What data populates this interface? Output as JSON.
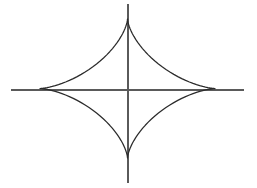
{
  "figure": {
    "background_color": "#ffffff",
    "width": 257,
    "height": 188
  },
  "chart_data": {
    "type": "line",
    "title": "",
    "subtitle": "",
    "xlabel": "",
    "ylabel": "",
    "grid": false,
    "legend_position": "none",
    "tick_labels_x": [],
    "tick_labels_y": [],
    "annotations": [],
    "curve_name": "astroid",
    "curve_equation": "|x/a|^(2/3) + |y/b|^(2/3) = 1",
    "axes": {
      "x_axis": {
        "y_pixel": 90,
        "x_start_pixel": 11,
        "x_end_pixel": 244,
        "color": "#5a5a5a"
      },
      "y_axis": {
        "x_pixel": 128,
        "y_start_pixel": 4,
        "y_end_pixel": 183,
        "color": "#5a5a5a"
      }
    },
    "curve_style": {
      "color": "#2b2b2b",
      "stroke_width": 1.25,
      "fill": "none"
    },
    "cusps": [
      {
        "name": "top-left",
        "x": 40,
        "y": 19
      },
      {
        "name": "top-right",
        "x": 215,
        "y": 19
      },
      {
        "name": "bottom-right",
        "x": 215,
        "y": 158
      },
      {
        "name": "bottom-left",
        "x": 40,
        "y": 158
      }
    ],
    "axis_crossings": [
      {
        "name": "left-arc-crosses-x-axis",
        "x": 67,
        "y": 90
      },
      {
        "name": "right-arc-crosses-x-axis",
        "x": 189,
        "y": 90
      },
      {
        "name": "top-arc-crosses-y-axis",
        "x": 128,
        "y": 48
      },
      {
        "name": "bottom-arc-crosses-y-axis",
        "x": 128,
        "y": 130
      }
    ],
    "curve_center": {
      "x": 127.5,
      "y": 88.5
    },
    "semi_axis_a": 87.5,
    "semi_axis_b": 69.5,
    "path_d": "M 40 19 C 98 44 120 57 127.5 64 C 135 57 157 44 215 19 C 190 64 177 81 170 88.5 C 177 96 190 113 215 158 C 157 133 135 120 127.5 113 C 120 120 98 133 40 158 C 65 113 78 96 85 88.5 C 78 81 65 64 40 19 Z"
  }
}
